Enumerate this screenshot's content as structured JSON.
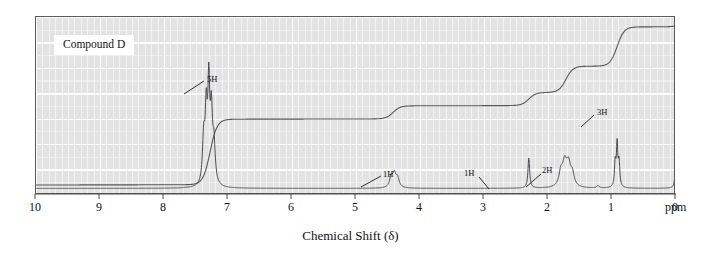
{
  "figure": {
    "compound_label": "Compound D",
    "xlabel": "Chemical Shift (δ)",
    "ppm_unit": "ppm"
  },
  "axis": {
    "ticks": [
      "10",
      "9",
      "8",
      "7",
      "6",
      "5",
      "4",
      "3",
      "2",
      "1",
      "0"
    ]
  },
  "annotations": {
    "a0": "5H",
    "a1": "1H",
    "a2": "1H",
    "a3": "2H",
    "a4": "3H"
  },
  "colors": {
    "plot_background": "#e3e3e3",
    "gridline": "#ffffff",
    "frame": "#5a5a5a",
    "trace": "#4a4a4a",
    "integral": "#555555",
    "text": "#111111"
  },
  "chart_data": {
    "type": "line",
    "title": "Compound D",
    "subtitle": "",
    "xlabel": "Chemical Shift (δ)",
    "ylabel": "",
    "xlim": [
      10,
      0
    ],
    "ylim": [
      0,
      1
    ],
    "x_unit": "ppm",
    "x_axis_inverted": true,
    "grid": true,
    "legend": "none",
    "technique": "1H NMR spectrum with integration trace",
    "peaks": [
      {
        "shift_ppm": 7.28,
        "integration": "5H",
        "label": "5H",
        "multiplicity": "multiplet",
        "relative_height": 0.62,
        "assignment": "aromatic"
      },
      {
        "shift_ppm": 4.42,
        "integration": "1H",
        "label": "1H",
        "multiplicity": "multiplet",
        "relative_height": 0.1
      },
      {
        "shift_ppm": 2.3,
        "integration": "1H",
        "label": "1H",
        "multiplicity": "singlet",
        "relative_height": 0.2
      },
      {
        "shift_ppm": 1.72,
        "integration": "2H",
        "label": "2H",
        "multiplicity": "multiplet",
        "relative_height": 0.16
      },
      {
        "shift_ppm": 0.92,
        "integration": "3H",
        "label": "3H",
        "multiplicity": "triplet",
        "relative_height": 0.28
      },
      {
        "shift_ppm": 0.0,
        "integration": "",
        "label": "TMS",
        "multiplicity": "singlet",
        "relative_height": 0.26
      }
    ],
    "integration_steps": [
      {
        "shift_ppm": 7.28,
        "protons": 5,
        "step_height_fraction": 0.455
      },
      {
        "shift_ppm": 4.42,
        "protons": 1,
        "step_height_fraction": 0.091
      },
      {
        "shift_ppm": 2.3,
        "protons": 1,
        "step_height_fraction": 0.091
      },
      {
        "shift_ppm": 1.72,
        "protons": 2,
        "step_height_fraction": 0.182
      },
      {
        "shift_ppm": 0.92,
        "protons": 3,
        "step_height_fraction": 0.273
      }
    ],
    "total_protons": 12
  }
}
